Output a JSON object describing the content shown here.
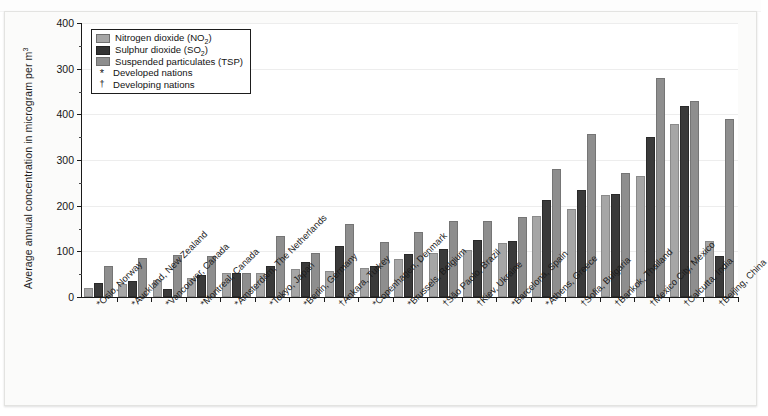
{
  "figure": {
    "y_axis_title": "Average annual concentration in microgram per m",
    "y_axis_title_sup": "3"
  },
  "legend": {
    "items": [
      {
        "kind": "swatch",
        "series": "no2",
        "label_main": "Nitrogen dioxide (NO",
        "label_sub": "2",
        "label_tail": ")"
      },
      {
        "kind": "swatch",
        "series": "so2",
        "label_main": "Sulphur dioxide (SO",
        "label_sub": "2",
        "label_tail": ")"
      },
      {
        "kind": "swatch",
        "series": "tsp",
        "label_main": "Suspended particulates (TSP)",
        "label_sub": "",
        "label_tail": ""
      },
      {
        "kind": "symbol",
        "symbol": "*",
        "label_main": "Developed nations",
        "label_sub": "",
        "label_tail": ""
      },
      {
        "kind": "symbol",
        "symbol": "†",
        "label_main": "Developing nations",
        "label_sub": "",
        "label_tail": ""
      }
    ]
  },
  "colors": {
    "no2": "#a6a6a6",
    "so2": "#3a3a3a",
    "tsp": "#8e8e8e",
    "axis": "#1a1a1a",
    "grid": "#ededed",
    "card_background": "#fbfbfa",
    "plot_background": "#ffffff"
  },
  "chart_data": {
    "type": "bar",
    "title": "",
    "subtitle": "",
    "xlabel": "",
    "ylabel": "Average annual concentration in microgram per m3",
    "ylim": [
      0,
      600
    ],
    "yticks": [
      0,
      100,
      200,
      300,
      400,
      500,
      600
    ],
    "ytick_labels": [
      "0",
      "100",
      "200",
      "300",
      "400",
      "300",
      "400"
    ],
    "ytick_labels_note": "As printed in the scanned original: the two uppermost labels read '300' and '400' (a reproduction artefact); the tick spacing is uniform at 100 units.",
    "grid": true,
    "grid_axis": "y",
    "legend_position": "top-left inside plot",
    "categories": [
      "Oslo, Norway*",
      "Auckland, New Zealand*",
      "Vancouver, Canada*",
      "Montreal, Canada*",
      "Amsterdam, The Netherlands*",
      "Tokyo, Japan*",
      "Berlin, Germany*",
      "Ankara, Turkey†",
      "Copenhagen, Denmark*",
      "Brussels, Belgium*",
      "São Paolo, Brazil†",
      "Kiev, Ukraine†",
      "Barcelona, Spain*",
      "Athens, Greece*",
      "Sofia, Bulgaria†",
      "Bankok, Thailand†",
      "Mexico City, Mexico†",
      "Calcutta, India†",
      "Beijing, China†"
    ],
    "series": [
      {
        "name": "Nitrogen dioxide (NO2)",
        "key": "no2",
        "color": "#a6a6a6",
        "values": [
          20,
          29,
          37,
          42,
          52,
          52,
          62,
          58,
          63,
          83,
          96,
          102,
          118,
          177,
          192,
          223,
          264,
          378,
          122
        ]
      },
      {
        "name": "Sulphur dioxide (SO2)",
        "key": "so2",
        "color": "#3a3a3a",
        "values": [
          31,
          34,
          17,
          48,
          52,
          67,
          77,
          111,
          67,
          94,
          106,
          125,
          123,
          212,
          234,
          226,
          350,
          419,
          90
        ]
      },
      {
        "name": "Suspended particulates (TSP)",
        "key": "tsp",
        "color": "#8e8e8e",
        "values": [
          68,
          85,
          92,
          90,
          53,
          134,
          97,
          160,
          121,
          143,
          166,
          167,
          176,
          281,
          357,
          272,
          480,
          430,
          390
        ]
      }
    ]
  }
}
